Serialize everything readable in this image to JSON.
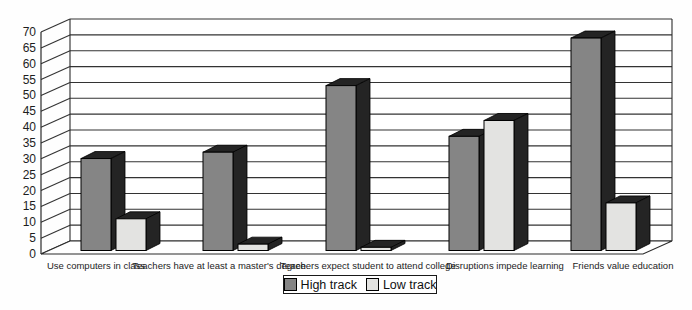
{
  "chart_data": {
    "type": "bar",
    "style": "3d-extruded-grouped",
    "title": "",
    "xlabel": "",
    "ylabel": "",
    "categories": [
      "Use computers in class",
      "Teachers have at least a master's degree",
      "Teachers expect student to attend college",
      "Disruptions impede learning",
      "Friends value education"
    ],
    "series": [
      {
        "name": "High track",
        "color": "#858585",
        "values": [
          29,
          31,
          52,
          36,
          67
        ]
      },
      {
        "name": "Low track",
        "color": "#e3e3e1",
        "values": [
          10,
          2,
          1,
          41,
          15
        ]
      }
    ],
    "ylim": [
      0,
      70
    ],
    "ytick_step": 5,
    "yticks": [
      0,
      5,
      10,
      15,
      20,
      25,
      30,
      35,
      40,
      45,
      50,
      55,
      60,
      65,
      70
    ],
    "grid": true,
    "legend_position": "bottom-center",
    "colors": {
      "extrusion": "#242424",
      "grid_line": "#333333",
      "axis_line": "#2b2b2b",
      "wall_background": "#ffffff",
      "text": "#1d1d1d"
    }
  }
}
